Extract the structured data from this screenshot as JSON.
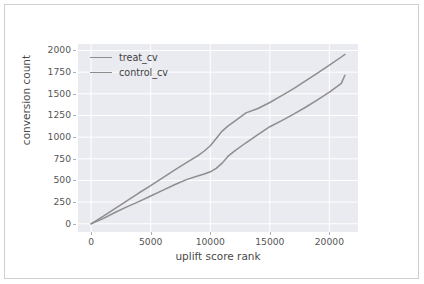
{
  "figure": {
    "background": "#ffffff",
    "border_color": "#cfcfcf",
    "plot_background": "#eaeaf1",
    "grid_color": "#ffffff",
    "tick_color": "#555555",
    "label_color": "#4a4a4a"
  },
  "chart_data": {
    "type": "line",
    "title": "",
    "xlabel": "uplift score rank",
    "ylabel": "conversion count",
    "xlim": [
      -1100,
      22400
    ],
    "ylim": [
      -95,
      2075
    ],
    "xticks": [
      0,
      5000,
      10000,
      15000,
      20000
    ],
    "xtick_labels": [
      "0",
      "5000",
      "10000",
      "15000",
      "20000"
    ],
    "yticks": [
      0,
      250,
      500,
      750,
      1000,
      1250,
      1500,
      1750,
      2000
    ],
    "ytick_labels": [
      "0",
      "250",
      "500",
      "750",
      "1000",
      "1250",
      "1500",
      "1750",
      "2000"
    ],
    "grid": true,
    "legend_position": "upper left",
    "series": [
      {
        "name": "treat_cv",
        "color": "#8e8e8e",
        "x": [
          0,
          1000,
          2000,
          3000,
          4000,
          5000,
          6000,
          7000,
          8000,
          9000,
          9500,
          10000,
          10500,
          11000,
          11500,
          12000,
          13000,
          14000,
          15000,
          16000,
          17000,
          18000,
          19000,
          20000,
          21000,
          21300
        ],
        "y": [
          0,
          85,
          175,
          265,
          355,
          440,
          530,
          620,
          705,
          790,
          840,
          900,
          985,
          1070,
          1130,
          1180,
          1280,
          1330,
          1400,
          1480,
          1560,
          1650,
          1740,
          1830,
          1925,
          1955
        ]
      },
      {
        "name": "control_cv",
        "color": "#8e8e8e",
        "x": [
          0,
          1000,
          2000,
          3000,
          4000,
          5000,
          6000,
          7000,
          8000,
          9000,
          9500,
          10000,
          10500,
          11000,
          11500,
          12000,
          13000,
          14000,
          15000,
          16000,
          17000,
          18000,
          19000,
          20000,
          21000,
          21300
        ],
        "y": [
          0,
          60,
          130,
          195,
          255,
          320,
          385,
          450,
          510,
          555,
          575,
          600,
          640,
          700,
          780,
          835,
          935,
          1030,
          1120,
          1190,
          1265,
          1345,
          1430,
          1520,
          1620,
          1715
        ]
      }
    ]
  },
  "legend": {
    "entries": [
      {
        "label": "treat_cv"
      },
      {
        "label": "control_cv"
      }
    ]
  }
}
